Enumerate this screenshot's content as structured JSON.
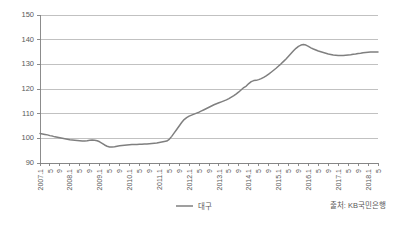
{
  "chart_data": {
    "type": "line",
    "title": "",
    "xlabel": "",
    "ylabel": "",
    "ylim": [
      90,
      150
    ],
    "ytick_step": 10,
    "grid": true,
    "legend_position": "bottom-center",
    "yticks": [
      "150",
      "140",
      "130",
      "120",
      "110",
      "100",
      "90"
    ],
    "series": [
      {
        "name": "대구",
        "color": "#7f7f7f",
        "values": [
          102.0,
          101.8,
          101.6,
          101.4,
          101.1,
          100.9,
          100.6,
          100.4,
          100.2,
          100.0,
          99.8,
          99.6,
          99.4,
          99.3,
          99.2,
          99.1,
          99.0,
          98.9,
          98.9,
          99.0,
          99.2,
          99.3,
          99.2,
          99.0,
          98.6,
          98.0,
          97.3,
          96.8,
          96.5,
          96.5,
          96.6,
          96.8,
          97.0,
          97.1,
          97.2,
          97.3,
          97.4,
          97.5,
          97.5,
          97.5,
          97.6,
          97.6,
          97.7,
          97.7,
          97.8,
          97.9,
          98.0,
          98.1,
          98.3,
          98.5,
          98.7,
          98.9,
          99.6,
          100.8,
          102.2,
          103.6,
          105.0,
          106.4,
          107.6,
          108.4,
          109.0,
          109.4,
          109.8,
          110.2,
          110.6,
          111.1,
          111.6,
          112.1,
          112.6,
          113.1,
          113.6,
          114.0,
          114.4,
          114.8,
          115.2,
          115.6,
          116.1,
          116.7,
          117.3,
          118.0,
          118.8,
          119.7,
          120.6,
          121.2,
          122.2,
          123.0,
          123.4,
          123.5,
          123.8,
          124.2,
          124.7,
          125.3,
          126.0,
          126.8,
          127.6,
          128.4,
          129.3,
          130.2,
          131.2,
          132.2,
          133.3,
          134.4,
          135.5,
          136.5,
          137.3,
          137.8,
          138.0,
          137.8,
          137.3,
          136.7,
          136.2,
          135.8,
          135.4,
          135.1,
          134.8,
          134.5,
          134.2,
          134.0,
          133.8,
          133.7,
          133.6,
          133.6,
          133.6,
          133.7,
          133.8,
          133.9,
          134.1,
          134.2,
          134.4,
          134.5,
          134.7,
          134.8,
          134.9,
          135.0,
          135.0,
          135.0,
          135.0
        ]
      }
    ],
    "x_start_year": 2007,
    "x_start_month": 1,
    "x_end_year": 2018,
    "x_end_month": 5,
    "xtick_labels": [
      "2007.1",
      "5",
      "9",
      "2008.1",
      "5",
      "9",
      "2009.1",
      "5",
      "9",
      "2010.1",
      "5",
      "9",
      "2011.1",
      "5",
      "9",
      "2012.1",
      "5",
      "9",
      "2013.1",
      "5",
      "9",
      "2014.1",
      "5",
      "9",
      "2015.1",
      "5",
      "9",
      "2016.1",
      "5",
      "9",
      "2017.1",
      "5",
      "9",
      "2018.1",
      "5"
    ]
  },
  "legend": {
    "entries": [
      {
        "label": "대구"
      }
    ]
  },
  "footer": {
    "source": "출처: KB국민은행"
  }
}
